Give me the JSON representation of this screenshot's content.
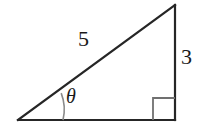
{
  "figure": {
    "name": "right-triangle-trigonometry-diagram",
    "background_color": "#ffffff",
    "stroke_color": "#262626",
    "labels": {
      "hypotenuse": "5",
      "opposite_side": "3",
      "angle": "θ"
    },
    "icon_names": {
      "right_angle": "right-angle-marker-icon",
      "angle_arc": "angle-arc-icon"
    },
    "geometry": {
      "vertex_angle": [
        18,
        120
      ],
      "vertex_right": [
        175,
        120
      ],
      "vertex_top": [
        175,
        5
      ],
      "right_angle_square_size": 22,
      "angle_arc_radius": 45
    }
  }
}
